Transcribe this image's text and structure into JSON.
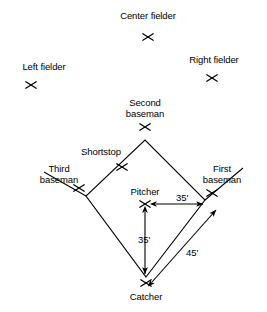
{
  "diagram": {
    "background_color": "#ffffff",
    "line_color": "#000000",
    "positions": [
      {
        "key": "center_fielder",
        "label": "Center fielder",
        "marker": "x-marker",
        "label_x": 148,
        "label_y": 10,
        "marker_x": 148,
        "marker_y": 37
      },
      {
        "key": "left_fielder",
        "label": "Left fielder",
        "marker": "x-marker",
        "label_x": 44,
        "label_y": 61,
        "marker_x": 31,
        "marker_y": 85
      },
      {
        "key": "right_fielder",
        "label": "Right fielder",
        "marker": "x-marker",
        "label_x": 214,
        "label_y": 54,
        "marker_x": 212,
        "marker_y": 78
      },
      {
        "key": "second_baseman",
        "label": "Second baseman",
        "marker": "x-marker",
        "label_x": 145,
        "label_y": 97,
        "marker_x": 145,
        "marker_y": 127
      },
      {
        "key": "shortstop",
        "label": "Shortstop",
        "marker": "x-marker",
        "label_x": 101,
        "label_y": 146,
        "marker_x": 122,
        "marker_y": 167
      },
      {
        "key": "third_baseman",
        "label": "Third baseman",
        "marker": "x-marker",
        "label_x": 59,
        "label_y": 163,
        "marker_x": 79,
        "marker_y": 188
      },
      {
        "key": "first_baseman",
        "label": "First baseman",
        "marker": "x-marker",
        "label_x": 222,
        "label_y": 163,
        "marker_x": 212,
        "marker_y": 193
      },
      {
        "key": "pitcher",
        "label": "Pitcher",
        "marker": "x-marker",
        "label_x": 145,
        "label_y": 186,
        "marker_x": 145,
        "marker_y": 204
      },
      {
        "key": "catcher",
        "label": "Catcher",
        "marker": "x-marker",
        "label_x": 146,
        "label_y": 291,
        "marker_x": 146,
        "marker_y": 283
      }
    ],
    "bases": {
      "home": {
        "x": 146,
        "y": 277
      },
      "first": {
        "x": 205,
        "y": 200
      },
      "second": {
        "x": 145,
        "y": 140
      },
      "third": {
        "x": 86,
        "y": 196
      }
    },
    "dimensions": [
      {
        "key": "pitcher_to_first",
        "label": "35'",
        "orientation": "horizontal",
        "label_x": 176,
        "label_y": 192,
        "from_x": 155,
        "from_y": 204,
        "to_x": 203,
        "to_y": 204
      },
      {
        "key": "pitcher_to_home",
        "label": "35'",
        "orientation": "vertical",
        "label_x": 138,
        "label_y": 234,
        "from_x": 145,
        "from_y": 213,
        "to_x": 145,
        "to_y": 275
      },
      {
        "key": "home_to_first",
        "label": "45'",
        "orientation": "diagonal",
        "label_x": 186,
        "label_y": 247,
        "from_x": 152,
        "from_y": 281,
        "to_x": 215,
        "to_y": 211
      }
    ]
  }
}
